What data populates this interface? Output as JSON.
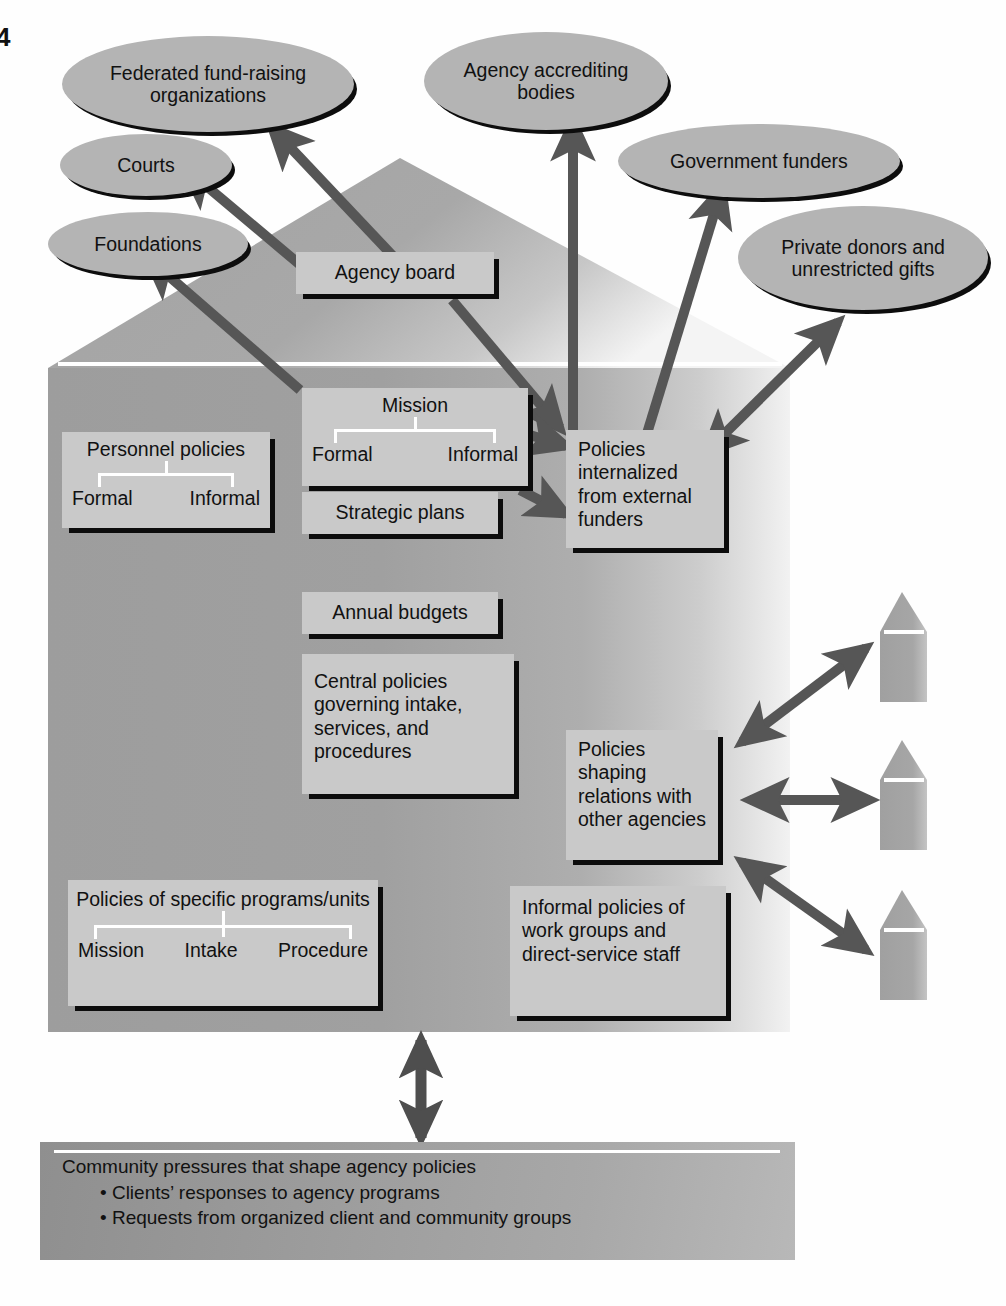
{
  "page": {
    "number": "4"
  },
  "diagram": {
    "title_alt": "Agency policy environment diagram",
    "external_entities": [
      {
        "id": "federated",
        "label": "Federated fund-raising organizations"
      },
      {
        "id": "courts",
        "label": "Courts"
      },
      {
        "id": "foundations",
        "label": "Foundations"
      },
      {
        "id": "accrediting",
        "label": "Agency accrediting bodies"
      },
      {
        "id": "government",
        "label": "Government funders"
      },
      {
        "id": "private",
        "label": "Private donors and unrestricted gifts"
      }
    ],
    "boxes": [
      {
        "id": "agency-board",
        "label": "Agency board"
      },
      {
        "id": "personnel",
        "label": "Personnel policies",
        "sub_left": "Formal",
        "sub_right": "Informal"
      },
      {
        "id": "mission",
        "label": "Mission",
        "sub_left": "Formal",
        "sub_right": "Informal"
      },
      {
        "id": "strategic",
        "label": "Strategic plans"
      },
      {
        "id": "budgets",
        "label": "Annual budgets"
      },
      {
        "id": "central",
        "label": "Central policies governing intake, services, and procedures"
      },
      {
        "id": "internalized",
        "label": "Policies internalized from external funders"
      },
      {
        "id": "relations",
        "label": "Policies shaping relations with other agencies"
      },
      {
        "id": "informal",
        "label": "Informal policies of  work groups and direct-service staff"
      },
      {
        "id": "specific",
        "label": "Policies of specific programs/units",
        "sub_a": "Mission",
        "sub_b": "Intake",
        "sub_c": "Procedure"
      }
    ],
    "other_agencies": [
      {
        "id": "agency-house-1",
        "label": ""
      },
      {
        "id": "agency-house-2",
        "label": ""
      },
      {
        "id": "agency-house-3",
        "label": ""
      }
    ],
    "community": {
      "heading": "Community pressures that shape agency policies",
      "bullets": [
        "• Clients’ responses to agency programs",
        "• Requests from organized client and community groups"
      ]
    },
    "colors": {
      "house_body": "#9a9a9a",
      "box_fill": "#c9c9c9",
      "ellipse_fill": "#b4b4b4",
      "arrow": "#565656",
      "shadow": "#0c0c0c",
      "rule": "#ffffff"
    }
  }
}
